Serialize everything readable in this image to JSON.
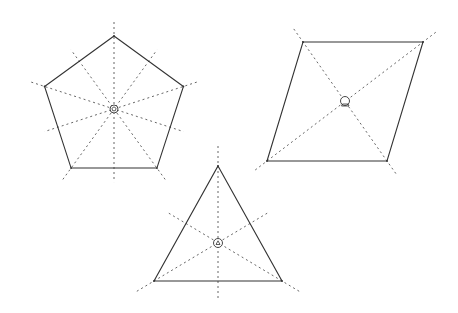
{
  "colors": {
    "edge": "#333333",
    "axis": "#555555",
    "background": "#ffffff"
  },
  "shapes": [
    {
      "id": "pentagon",
      "label": "Regular pentagon",
      "sides": 5,
      "lines_of_symmetry": 5,
      "center_marker": "pentagon-center-icon"
    },
    {
      "id": "rhombus",
      "label": "Rhombus",
      "sides": 4,
      "lines_of_symmetry": 2,
      "center_marker": "rhombus-center-icon"
    },
    {
      "id": "triangle",
      "label": "Equilateral triangle",
      "sides": 3,
      "lines_of_symmetry": 3,
      "center_marker": "triangle-center-icon"
    }
  ]
}
